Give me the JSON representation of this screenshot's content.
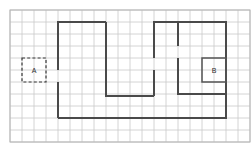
{
  "diagram": {
    "type": "floor-plan-on-grid",
    "canvas": {
      "width": 252,
      "height": 143
    },
    "grid": {
      "origin_x": 10,
      "origin_y": 10,
      "cell_size": 12,
      "columns": 20,
      "rows": 11,
      "line_color": "#c9c9c9",
      "border_color": "#b4b4b4",
      "visible": true
    },
    "walls": {
      "color": "#4a4a4a",
      "stroke_width": 2,
      "segments": [
        "M 58 118 L 58 82",
        "M 58 70 L 58 22 L 106 22",
        "M 106 22 L 106 96 L 154 96",
        "M 154 96 L 154 70",
        "M 154 58 L 154 22 L 178 22",
        "M 178 22 L 178 46",
        "M 178 58 L 178 94 L 226 94",
        "M 178 22 L 226 22 L 226 118 L 58 118"
      ],
      "door_gaps": [
        {
          "name": "door-left",
          "x": 58,
          "y_from": 70,
          "y_to": 82
        },
        {
          "name": "door-mid-right",
          "x": 154,
          "y_from": 58,
          "y_to": 70
        },
        {
          "name": "door-right",
          "x": 178,
          "y_from": 46,
          "y_to": 58
        }
      ]
    },
    "markers": [
      {
        "id": "marker-a",
        "label": "A",
        "style": "dashed",
        "color": "#3a3a3a",
        "x": 22,
        "y": 58,
        "width": 24,
        "height": 24,
        "label_x": 34,
        "label_y": 71
      },
      {
        "id": "marker-b",
        "label": "B",
        "style": "solid",
        "color": "#555555",
        "x": 202,
        "y": 58,
        "width": 24,
        "height": 24,
        "label_x": 214,
        "label_y": 71
      }
    ]
  }
}
